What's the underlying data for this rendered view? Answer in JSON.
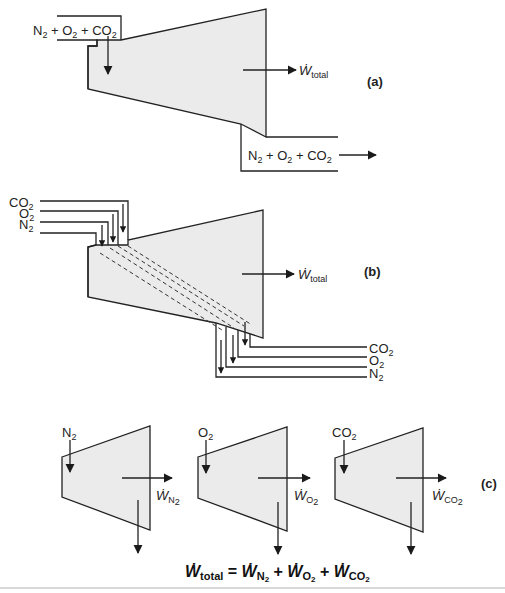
{
  "panels": {
    "a": {
      "label": "(a)",
      "inlet": {
        "parts": [
          {
            "t": "N",
            "s": "2"
          },
          {
            "t": " + O",
            "s": "2"
          },
          {
            "t": " + CO",
            "s": "2"
          }
        ]
      },
      "outlet": {
        "parts": [
          {
            "t": "N",
            "s": "2"
          },
          {
            "t": " + O",
            "s": "2"
          },
          {
            "t": " + CO",
            "s": "2"
          }
        ]
      },
      "work": {
        "symbol": "Ẇ",
        "sub": "total"
      }
    },
    "b": {
      "label": "(b)",
      "inlets": [
        {
          "t": "CO",
          "s": "2"
        },
        {
          "t": "O",
          "s": "2"
        },
        {
          "t": "N",
          "s": "2"
        }
      ],
      "outlets": [
        {
          "t": "CO",
          "s": "2"
        },
        {
          "t": "O",
          "s": "2"
        },
        {
          "t": "N",
          "s": "2"
        }
      ],
      "work": {
        "symbol": "Ẇ",
        "sub": "total"
      }
    },
    "c": {
      "label": "(c)",
      "turbines": [
        {
          "inlet": {
            "t": "N",
            "s": "2"
          },
          "work": {
            "symbol": "Ẇ",
            "sub": "N",
            "subsub": "2"
          }
        },
        {
          "inlet": {
            "t": "O",
            "s": "2"
          },
          "work": {
            "symbol": "Ẇ",
            "sub": "O",
            "subsub": "2"
          }
        },
        {
          "inlet": {
            "t": "CO",
            "s": "2"
          },
          "work": {
            "symbol": "Ẇ",
            "sub": "CO",
            "subsub": "2"
          }
        }
      ]
    }
  },
  "equation": {
    "lhs": {
      "symbol": "Ẇ",
      "sub": "total"
    },
    "eq": " = ",
    "terms": [
      {
        "symbol": "Ẇ",
        "sub": "N",
        "subsub": "2"
      },
      {
        "symbol": "Ẇ",
        "sub": "O",
        "subsub": "2"
      },
      {
        "symbol": "Ẇ",
        "sub": "CO",
        "subsub": "2"
      }
    ],
    "plus": " + "
  },
  "colors": {
    "body_fill": "#ebebeb",
    "stroke": "#222222"
  }
}
